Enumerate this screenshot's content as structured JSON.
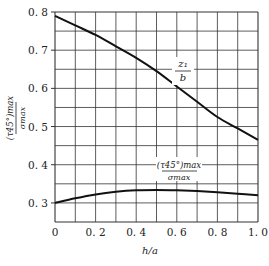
{
  "chart_data": {
    "type": "line",
    "title": "",
    "xlabel": "h/a",
    "ylabel": "(τ45°)max / σmax",
    "xlim": [
      0,
      1.0
    ],
    "ylim": [
      0.25,
      0.8
    ],
    "grid": true,
    "x_ticks": [
      "0",
      "0.2",
      "0.4",
      "0.6",
      "0.8",
      "1.0"
    ],
    "y_ticks": [
      "0.3",
      "0.4",
      "0.5",
      "0.6",
      "0.7",
      "0.8"
    ],
    "x": [
      0,
      0.1,
      0.2,
      0.3,
      0.4,
      0.5,
      0.6,
      0.7,
      0.8,
      0.9,
      1.0
    ],
    "series": [
      {
        "name": "z1/b",
        "label_num": "z1",
        "label_den": "b",
        "values": [
          0.79,
          0.765,
          0.74,
          0.71,
          0.68,
          0.645,
          0.605,
          0.565,
          0.525,
          0.495,
          0.465
        ]
      },
      {
        "name": "(τ45°)max/σmax",
        "label_num": "(τ45°)max",
        "label_den": "σmax",
        "values": [
          0.3,
          0.312,
          0.322,
          0.329,
          0.333,
          0.334,
          0.333,
          0.331,
          0.328,
          0.324,
          0.32
        ]
      }
    ]
  },
  "labels": {
    "xlabel": "h/a",
    "ylabel_num": "(τ45°)max",
    "ylabel_den": "σmax",
    "curve1_num": "z₁",
    "curve1_den": "b",
    "curve2_num": "(τ45°)max",
    "curve2_den": "σmax"
  }
}
